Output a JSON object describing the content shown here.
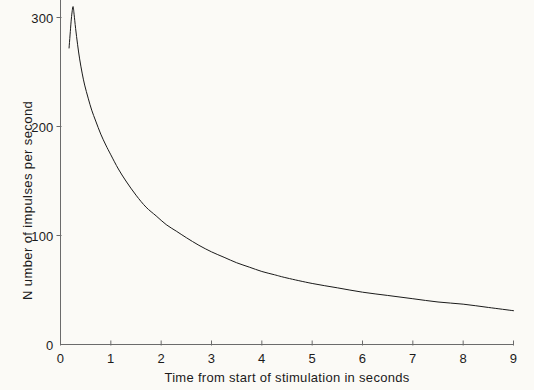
{
  "chart_data": {
    "type": "line",
    "title": "",
    "xlabel": "Time from start of stimulation in seconds",
    "ylabel": "N umber of impulses per second",
    "xlim": [
      0,
      9
    ],
    "ylim": [
      0,
      315
    ],
    "xticks": [
      "0",
      "1",
      "2",
      "3",
      "4",
      "5",
      "6",
      "7",
      "8",
      "9"
    ],
    "xtick_values": [
      0,
      1,
      2,
      3,
      4,
      5,
      6,
      7,
      8,
      9
    ],
    "yticks": [
      "0",
      "100",
      "200",
      "300"
    ],
    "ytick_values": [
      0,
      100,
      200,
      300
    ],
    "grid": false,
    "legend": null,
    "series": [
      {
        "name": "Impulse frequency",
        "color": "#1a1a1a",
        "line_width": 1,
        "x": [
          0.17,
          0.19,
          0.21,
          0.23,
          0.25,
          0.27,
          0.3,
          0.34,
          0.38,
          0.43,
          0.48,
          0.55,
          0.62,
          0.7,
          0.8,
          0.9,
          1.0,
          1.15,
          1.3,
          1.5,
          1.7,
          1.9,
          2.1,
          2.3,
          2.5,
          2.75,
          3.0,
          3.25,
          3.5,
          3.75,
          4.0,
          4.25,
          4.5,
          5.0,
          5.5,
          6.0,
          6.5,
          7.0,
          7.5,
          8.0,
          8.5,
          9.0
        ],
        "y": [
          272,
          284,
          296,
          305,
          310,
          303,
          290,
          275,
          262,
          249,
          238,
          226,
          215,
          205,
          193,
          183,
          174,
          161,
          150,
          137,
          126,
          118,
          110,
          104,
          98,
          91,
          85,
          80,
          75,
          71,
          67,
          64,
          61,
          56,
          52,
          48,
          45,
          42,
          39,
          37,
          34,
          31
        ]
      }
    ],
    "annotations": [],
    "axis_color": "#6b6b6b",
    "background_color": "#fbfaf6"
  },
  "axes": {
    "y_title": "N umber of impulses per second",
    "x_title": "Time from start of stimulation in seconds"
  },
  "y_tick_labels": [
    {
      "text": "300",
      "value": 300
    },
    {
      "text": "200",
      "value": 200
    },
    {
      "text": "100",
      "value": 100
    },
    {
      "text": "0",
      "value": 0
    }
  ],
  "x_tick_labels": [
    {
      "text": "0",
      "value": 0
    },
    {
      "text": "1",
      "value": 1
    },
    {
      "text": "2",
      "value": 2
    },
    {
      "text": "3",
      "value": 3
    },
    {
      "text": "4",
      "value": 4
    },
    {
      "text": "5",
      "value": 5
    },
    {
      "text": "6",
      "value": 6
    },
    {
      "text": "7",
      "value": 7
    },
    {
      "text": "8",
      "value": 8
    },
    {
      "text": "9",
      "value": 9
    }
  ]
}
